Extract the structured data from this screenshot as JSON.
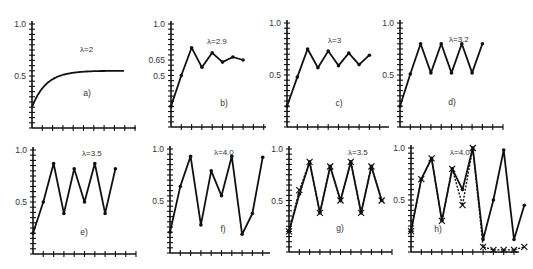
{
  "chart_data": [
    {
      "id": "a",
      "type": "line",
      "panel_label": "a)",
      "title": "λ=2",
      "ylim": [
        0,
        1.0
      ],
      "yticks": [
        "0.5",
        "1.0"
      ],
      "x_ticks": 10,
      "y_ticks": 11,
      "smooth": true,
      "markers": false,
      "series": [
        {
          "name": "x_n",
          "values": [
            0.2,
            0.32,
            0.436,
            0.492,
            0.4999,
            0.5,
            0.5,
            0.5,
            0.5
          ]
        }
      ]
    },
    {
      "id": "b",
      "type": "line",
      "panel_label": "b)",
      "title": "λ=2.9",
      "ylim": [
        0,
        1.0
      ],
      "yticks": [
        "0.5",
        "0.65",
        "1.0"
      ],
      "x_ticks": 10,
      "y_ticks": 11,
      "markers": true,
      "series": [
        {
          "name": "x_n",
          "values": [
            0.2,
            0.5,
            0.77,
            0.58,
            0.72,
            0.63,
            0.68,
            0.65
          ]
        }
      ]
    },
    {
      "id": "c",
      "type": "line",
      "panel_label": "c)",
      "title": "λ=3",
      "ylim": [
        0,
        1.0
      ],
      "yticks": [
        "0.5",
        "1.0"
      ],
      "x_ticks": 10,
      "y_ticks": 11,
      "markers": true,
      "series": [
        {
          "name": "x_n",
          "values": [
            0.2,
            0.48,
            0.75,
            0.57,
            0.73,
            0.59,
            0.71,
            0.6,
            0.69
          ]
        }
      ]
    },
    {
      "id": "d",
      "type": "line",
      "panel_label": "d)",
      "title": "λ=3.2",
      "ylim": [
        0,
        1.0
      ],
      "yticks": [
        "0.5",
        "1.0"
      ],
      "x_ticks": 10,
      "y_ticks": 11,
      "markers": true,
      "series": [
        {
          "name": "x_n",
          "values": [
            0.2,
            0.51,
            0.8,
            0.52,
            0.8,
            0.52,
            0.8,
            0.52,
            0.8
          ]
        }
      ]
    },
    {
      "id": "e",
      "type": "line",
      "panel_label": "e)",
      "title": "λ=3.5",
      "ylim": [
        0,
        1.0
      ],
      "yticks": [
        "0.5",
        "1.0"
      ],
      "x_ticks": 10,
      "y_ticks": 11,
      "markers": true,
      "series": [
        {
          "name": "x_n",
          "values": [
            0.2,
            0.5,
            0.87,
            0.39,
            0.82,
            0.5,
            0.87,
            0.39,
            0.82
          ]
        }
      ]
    },
    {
      "id": "f",
      "type": "line",
      "panel_label": "f)",
      "title": "λ=4.0",
      "ylim": [
        0,
        1.0
      ],
      "yticks": [
        "0.5",
        "1.0"
      ],
      "x_ticks": 10,
      "y_ticks": 11,
      "markers": true,
      "series": [
        {
          "name": "x_n",
          "values": [
            0.2,
            0.64,
            0.93,
            0.27,
            0.79,
            0.55,
            0.93,
            0.18,
            0.38,
            0.92
          ]
        }
      ]
    },
    {
      "id": "g",
      "type": "line",
      "panel_label": "g)",
      "title": "λ=3.5",
      "ylim": [
        0,
        1.0
      ],
      "yticks": [
        "0.5",
        "1.0"
      ],
      "x_ticks": 10,
      "y_ticks": 11,
      "markers": true,
      "second_series_markers": "x",
      "series": [
        {
          "name": "x_n",
          "values": [
            0.2,
            0.56,
            0.875,
            0.38,
            0.83,
            0.5,
            0.875,
            0.38,
            0.83,
            0.5
          ]
        },
        {
          "name": "x_n (perturbed)",
          "values": [
            0.2,
            0.6,
            0.875,
            0.38,
            0.83,
            0.5,
            0.875,
            0.38,
            0.83,
            0.5
          ]
        }
      ]
    },
    {
      "id": "h",
      "type": "line",
      "panel_label": "h)",
      "title": "λ=4.0",
      "ylim": [
        0,
        1.0
      ],
      "yticks": [
        "0.5",
        "1.0"
      ],
      "x_ticks": 10,
      "y_ticks": 11,
      "markers": true,
      "second_series_markers": "x",
      "series": [
        {
          "name": "x_n",
          "values": [
            0.2,
            0.7,
            0.9,
            0.3,
            0.8,
            0.6,
            1.0,
            0.12,
            0.5,
            0.98,
            0.12,
            0.45
          ]
        },
        {
          "name": "x_n (perturbed)",
          "values": [
            0.2,
            0.7,
            0.9,
            0.3,
            0.8,
            0.45,
            1.0,
            0.05,
            0.02,
            0.02,
            0.02,
            0.05
          ]
        }
      ]
    }
  ]
}
